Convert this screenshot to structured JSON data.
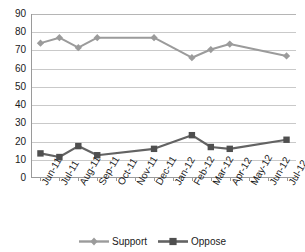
{
  "chart_data": {
    "type": "line",
    "title": "",
    "xlabel": "",
    "ylabel": "",
    "ylim": [
      0,
      90
    ],
    "ytick_step": 10,
    "yticks": [
      90,
      80,
      70,
      60,
      50,
      40,
      30,
      20,
      10,
      0
    ],
    "grid": true,
    "legend_position": "bottom",
    "categories": [
      "Jun-11",
      "Jul-11",
      "Aug-11",
      "Sep-11",
      "Oct-11",
      "Nov-11",
      "Dec-11",
      "Jan-12",
      "Feb-12",
      "Mar-12",
      "Apr-12",
      "May-12",
      "Jun-12",
      "Jul-12"
    ],
    "series": [
      {
        "name": "Support",
        "color": "#9b9b9b",
        "marker": "diamond",
        "values": [
          74,
          77,
          71.5,
          77,
          null,
          null,
          77,
          null,
          66,
          70.5,
          73.5,
          null,
          null,
          67
        ]
      },
      {
        "name": "Oppose",
        "color": "#636363",
        "marker": "square",
        "values": [
          13.5,
          11.5,
          17.5,
          12.5,
          null,
          null,
          16,
          null,
          23.5,
          17,
          16,
          null,
          null,
          21
        ]
      }
    ]
  },
  "legend": {
    "items": [
      {
        "label": "Support"
      },
      {
        "label": "Oppose"
      }
    ]
  }
}
